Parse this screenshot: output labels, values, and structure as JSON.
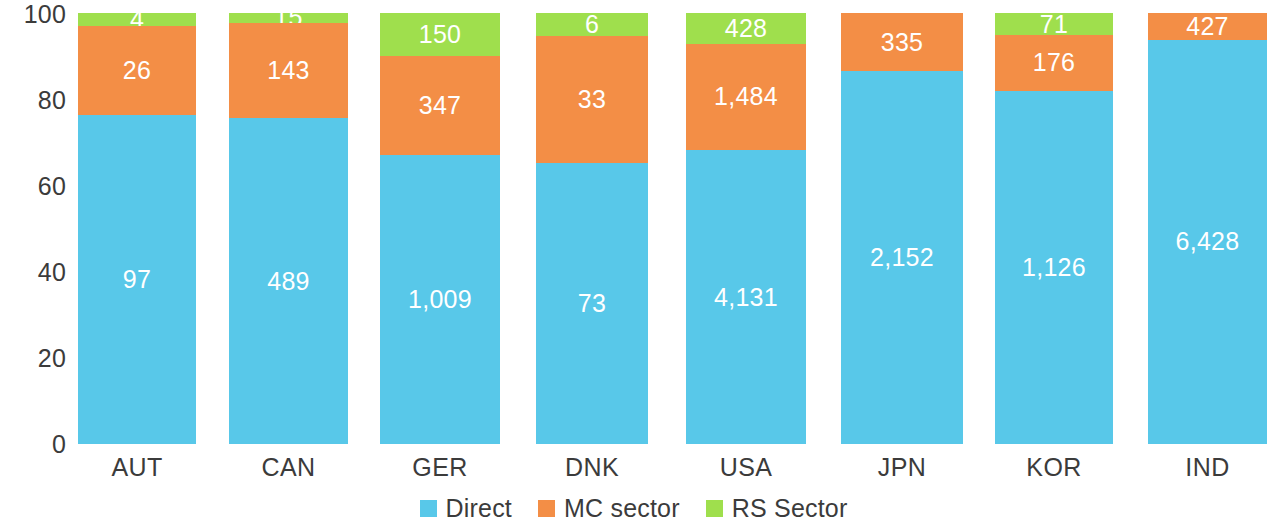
{
  "chart_data": {
    "type": "bar",
    "subtype": "stacked-100-percent-vertical",
    "title": "",
    "subtitle": "",
    "xlabel": "",
    "ylabel": "",
    "ylim": [
      0,
      100
    ],
    "yticks": [
      0,
      20,
      40,
      60,
      80,
      100
    ],
    "ytick_labels": [
      "0",
      "20",
      "40",
      "60",
      "80",
      "100"
    ],
    "grid": false,
    "legend_position": "bottom-center",
    "categories": [
      "AUT",
      "CAN",
      "GER",
      "DNK",
      "USA",
      "JPN",
      "KOR",
      "IND"
    ],
    "series": [
      {
        "name": "Direct",
        "color": "#58c8e9",
        "values": [
          97,
          489,
          1009,
          73,
          4131,
          2152,
          1126,
          6428
        ],
        "labels": [
          "97",
          "489",
          "1,009",
          "73",
          "4,131",
          "2,152",
          "1,126",
          "6,428"
        ],
        "percents": [
          76.4,
          75.6,
          67.0,
          65.2,
          68.4,
          86.5,
          82.0,
          93.8
        ]
      },
      {
        "name": "MC sector",
        "color": "#f38e46",
        "values": [
          26,
          143,
          347,
          33,
          1484,
          335,
          176,
          427
        ],
        "labels": [
          "26",
          "143",
          "347",
          "33",
          "1,484",
          "335",
          "176",
          "427"
        ],
        "percents": [
          20.5,
          22.1,
          23.0,
          29.5,
          24.6,
          13.5,
          12.8,
          6.2
        ]
      },
      {
        "name": "RS Sector",
        "color": "#9fdf4d",
        "values": [
          4,
          15,
          150,
          6,
          428,
          0,
          71,
          0
        ],
        "labels": [
          "4",
          "15",
          "150",
          "6",
          "428",
          "",
          "71",
          ""
        ],
        "percents": [
          3.1,
          2.3,
          10.0,
          5.3,
          7.1,
          0,
          5.2,
          0
        ]
      }
    ],
    "totals": [
      127,
      647,
      1506,
      112,
      6043,
      2487,
      1373,
      6855
    ]
  },
  "legend": {
    "items": [
      {
        "label": "Direct",
        "color": "#58c8e9",
        "icon": "square-swatch-icon"
      },
      {
        "label": "MC sector",
        "color": "#f38e46",
        "icon": "square-swatch-icon"
      },
      {
        "label": "RS Sector",
        "color": "#9fdf4d",
        "icon": "square-swatch-icon"
      }
    ]
  },
  "layout": {
    "plot_top_px": 13,
    "plot_bottom_px": 444,
    "bar_geometry": [
      {
        "left": 78,
        "width": 118
      },
      {
        "left": 229,
        "width": 119
      },
      {
        "left": 380,
        "width": 120
      },
      {
        "left": 536,
        "width": 112
      },
      {
        "left": 686,
        "width": 120
      },
      {
        "left": 841,
        "width": 122
      },
      {
        "left": 995,
        "width": 118
      },
      {
        "left": 1148,
        "width": 119
      }
    ],
    "ytick_y_px": [
      444,
      358,
      272,
      186,
      100,
      14
    ]
  }
}
